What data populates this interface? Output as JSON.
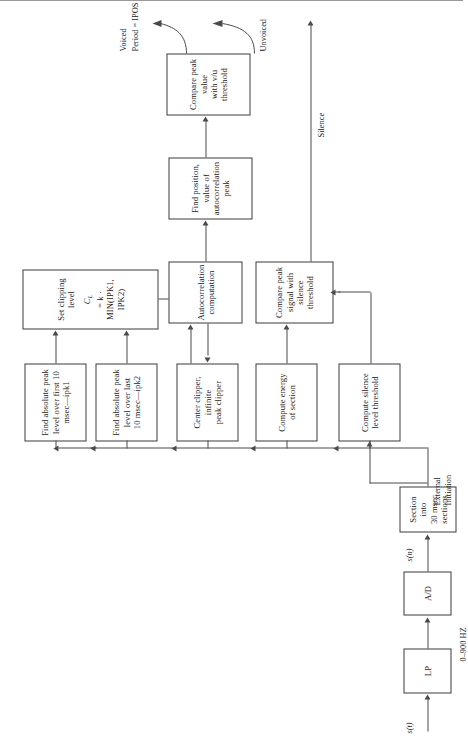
{
  "figure": {
    "orientation": "rotated-90"
  },
  "blocks": {
    "lp": {
      "line1": "LP"
    },
    "ad": {
      "line1": "A/D"
    },
    "section": {
      "line1": "Section into",
      "line2": "30 msec sections"
    },
    "peak_first": {
      "line1": "Find absolute peak",
      "line2": "level over first 10",
      "line3": "msec—ipk1"
    },
    "peak_last": {
      "line1": "Find absolute peak",
      "line2": "level over last",
      "line3": "10 msec—ipk2"
    },
    "clip_level": {
      "line1": "Set clipping",
      "line2": "level",
      "formula_lhs": "C",
      "formula_sub": "L",
      "formula_rhs": " = k · MIN(IPK1, IPK2)"
    },
    "center_clipper": {
      "line1": "Center clipper, infinite",
      "line2": "peak clipper"
    },
    "autocorr": {
      "line1": "Autocorrelation",
      "line2": "computation"
    },
    "find_peak": {
      "line1": "Find position, value of",
      "line2": "autocorrelation peak"
    },
    "compare_vu": {
      "line1": "Compare peak value",
      "line2": "with v/u threshold"
    },
    "energy": {
      "line1": "Compute energy",
      "line2": "of section"
    },
    "compare_sil": {
      "line1": "Compare peak signal with",
      "line2": "silence threshold"
    },
    "sil_thresh": {
      "line1": "Compute silence",
      "line2": "level threshold"
    }
  },
  "labels": {
    "input_signal": "s(t)",
    "sampled_signal": "s(n)",
    "bandwidth": "0–900 HZ",
    "external_initiation_l1": "External",
    "external_initiation_l2": "Initiation",
    "voiced": "Voiced",
    "period": "Period = IPOS",
    "unvoiced": "Unvoiced",
    "silence": "Silence"
  },
  "colors": {
    "line": "#4a4a4a",
    "border": "#3a3a3a",
    "text": "#1a1a1a",
    "background": "#ffffff"
  }
}
